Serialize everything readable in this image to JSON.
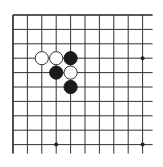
{
  "board": {
    "description": "Go board corner fragment (top-left region)",
    "grid": {
      "columns": 10,
      "rows": 10,
      "origin_x": 13,
      "origin_y": 15,
      "spacing": 14.4,
      "line_extension_right": 10,
      "line_extension_bottom": 9,
      "line_color": "#333333",
      "edge_line_color": "#222222"
    },
    "star_points": [
      {
        "col": 9,
        "row": 3
      },
      {
        "col": 3,
        "row": 9
      },
      {
        "col": 9,
        "row": 9
      }
    ],
    "stones": [
      {
        "color": "white",
        "col": 2,
        "row": 3
      },
      {
        "color": "white",
        "col": 3,
        "row": 3
      },
      {
        "color": "black",
        "col": 4,
        "row": 3
      },
      {
        "color": "black",
        "col": 3,
        "row": 4
      },
      {
        "color": "white",
        "col": 4,
        "row": 4
      },
      {
        "color": "black",
        "col": 4,
        "row": 5
      }
    ],
    "stone_radius": 6.6,
    "colors": {
      "background": "#ffffff",
      "black_stone": "#1a1a1a",
      "white_stone_fill": "#ffffff",
      "white_stone_stroke": "#333333",
      "star_point": "#222222"
    }
  }
}
